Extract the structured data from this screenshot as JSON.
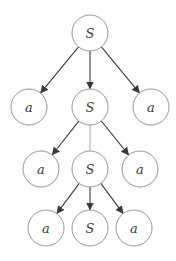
{
  "diagram": {
    "type": "tree",
    "node_radius": 18,
    "colors": {
      "node_stroke": "#8a8a8a",
      "edge": "#3a3a3a",
      "edge_plain": "#9a9a9a",
      "label": "#3a3a3a",
      "background": "#ffffff"
    },
    "nodes": [
      {
        "id": "n0",
        "label": "S",
        "x": 90,
        "y": 33
      },
      {
        "id": "n1",
        "label": "a",
        "x": 29,
        "y": 107
      },
      {
        "id": "n2",
        "label": "S",
        "x": 90,
        "y": 107
      },
      {
        "id": "n3",
        "label": "a",
        "x": 151,
        "y": 107
      },
      {
        "id": "n4",
        "label": "a",
        "x": 41,
        "y": 169
      },
      {
        "id": "n5",
        "label": "S",
        "x": 90,
        "y": 169
      },
      {
        "id": "n6",
        "label": "a",
        "x": 140,
        "y": 169
      },
      {
        "id": "n7",
        "label": "a",
        "x": 46,
        "y": 228
      },
      {
        "id": "n8",
        "label": "S",
        "x": 90,
        "y": 228
      },
      {
        "id": "n9",
        "label": "a",
        "x": 134,
        "y": 228
      }
    ],
    "edges": [
      {
        "from": "n0",
        "to": "n1",
        "arrow": true
      },
      {
        "from": "n0",
        "to": "n2",
        "arrow": true
      },
      {
        "from": "n0",
        "to": "n3",
        "arrow": true
      },
      {
        "from": "n2",
        "to": "n4",
        "arrow": true
      },
      {
        "from": "n2",
        "to": "n5",
        "arrow": false
      },
      {
        "from": "n2",
        "to": "n6",
        "arrow": true
      },
      {
        "from": "n5",
        "to": "n7",
        "arrow": true
      },
      {
        "from": "n5",
        "to": "n8",
        "arrow": true
      },
      {
        "from": "n5",
        "to": "n9",
        "arrow": true
      }
    ]
  }
}
